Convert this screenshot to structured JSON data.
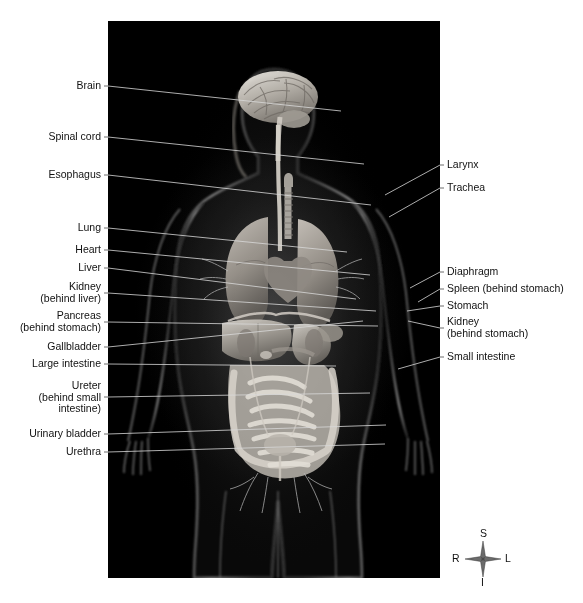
{
  "figure": {
    "background_color": "#ffffff",
    "panel_color": "#000000",
    "label_color": "#111111",
    "leader_line_color": "#d9d9d9",
    "leader_line_color_outside": "#555555"
  },
  "labels_left": [
    {
      "name": "brain",
      "text": "Brain",
      "x": 101,
      "y": 86,
      "line_to_x": 233,
      "line_to_y": 90
    },
    {
      "name": "spinal-cord",
      "text": "Spinal cord",
      "x": 101,
      "y": 137,
      "line_to_x": 256,
      "line_to_y": 143
    },
    {
      "name": "esophagus",
      "text": "Esophagus",
      "x": 101,
      "y": 175,
      "line_to_x": 263,
      "line_to_y": 184
    },
    {
      "name": "lung",
      "text": "Lung",
      "x": 101,
      "y": 228,
      "line_to_x": 239,
      "line_to_y": 231
    },
    {
      "name": "heart",
      "text": "Heart",
      "x": 101,
      "y": 250,
      "line_to_x": 262,
      "line_to_y": 254
    },
    {
      "name": "liver",
      "text": "Liver",
      "x": 101,
      "y": 268,
      "line_to_x": 248,
      "line_to_y": 278
    },
    {
      "name": "kidney-left",
      "text": "Kidney\n(behind liver)",
      "x": 101,
      "y": 293,
      "line_to_x": 268,
      "line_to_y": 290
    },
    {
      "name": "pancreas",
      "text": "Pancreas\n(behind stomach)",
      "x": 101,
      "y": 322,
      "line_to_x": 270,
      "line_to_y": 305
    },
    {
      "name": "gallbladder",
      "text": "Gallbladder",
      "x": 101,
      "y": 347,
      "line_to_x": 255,
      "line_to_y": 300
    },
    {
      "name": "large-intestine",
      "text": "Large intestine",
      "x": 101,
      "y": 364,
      "line_to_x": 228,
      "line_to_y": 345
    },
    {
      "name": "ureter",
      "text": "Ureter\n(behind small\nintestine)",
      "x": 101,
      "y": 397,
      "line_to_x": 262,
      "line_to_y": 372
    },
    {
      "name": "urinary-bladder",
      "text": "Urinary bladder",
      "x": 101,
      "y": 434,
      "line_to_x": 278,
      "line_to_y": 404
    },
    {
      "name": "urethra",
      "text": "Urethra",
      "x": 101,
      "y": 452,
      "line_to_x": 277,
      "line_to_y": 423
    }
  ],
  "labels_right": [
    {
      "name": "larynx",
      "text": "Larynx",
      "x": 447,
      "y": 165,
      "line_to_x": 277,
      "line_to_y": 174
    },
    {
      "name": "trachea",
      "text": "Trachea",
      "x": 447,
      "y": 188,
      "line_to_x": 281,
      "line_to_y": 196
    },
    {
      "name": "diaphragm",
      "text": "Diaphragm",
      "x": 447,
      "y": 272,
      "line_to_x": 302,
      "line_to_y": 267
    },
    {
      "name": "spleen",
      "text": "Spleen (behind stomach)",
      "x": 447,
      "y": 289,
      "line_to_x": 310,
      "line_to_y": 281
    },
    {
      "name": "stomach",
      "text": "Stomach",
      "x": 447,
      "y": 306,
      "line_to_x": 299,
      "line_to_y": 290
    },
    {
      "name": "kidney-right",
      "text": "Kidney\n(behind stomach)",
      "x": 447,
      "y": 328,
      "line_to_x": 300,
      "line_to_y": 300
    },
    {
      "name": "small-intestine",
      "text": "Small intestine",
      "x": 447,
      "y": 357,
      "line_to_x": 290,
      "line_to_y": 348
    }
  ],
  "compass": {
    "name": "orientation-compass",
    "superior": "S",
    "inferior": "I",
    "right": "R",
    "left": "L"
  }
}
